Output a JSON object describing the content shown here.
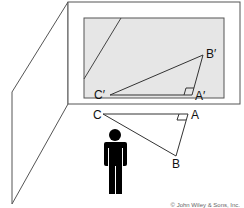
{
  "diagram": {
    "colors": {
      "line": "#444444",
      "screen_fill": "#e6e6e6",
      "figure": "#000000",
      "background": "#ffffff"
    },
    "labels": {
      "projected_triangle": {
        "b_prime": "B′",
        "c_prime": "C′",
        "a_prime": "A′"
      },
      "original_triangle": {
        "c": "C",
        "a": "A",
        "b": "B"
      }
    },
    "copyright": "© John Wiley & Sons, Inc."
  }
}
